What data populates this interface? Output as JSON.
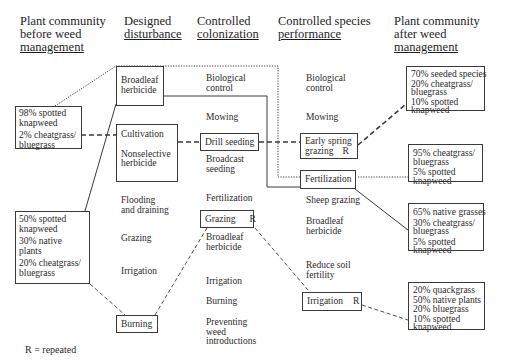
{
  "headers": [
    {
      "id": "before",
      "lines": [
        "Plant community",
        "before weed"
      ],
      "underlined": "management"
    },
    {
      "id": "disturbance",
      "lines": [
        "Designed"
      ],
      "underlined": "disturbance"
    },
    {
      "id": "colonization",
      "lines": [
        "Controlled"
      ],
      "underlined": "colonization"
    },
    {
      "id": "performance",
      "lines": [
        "Controlled species"
      ],
      "underlined": "performance"
    },
    {
      "id": "after",
      "lines": [
        "Plant community",
        "after weed"
      ],
      "underlined": "management"
    }
  ],
  "before_communities": [
    {
      "lines": [
        "98% spotted",
        "knapweed",
        "2% cheatgrass/",
        "bluegrass"
      ]
    },
    {
      "lines": [
        "50% spotted",
        "knapweed",
        "30% native",
        "plants",
        "20% cheatgrass/",
        "bluegrass"
      ]
    }
  ],
  "disturbance": {
    "boxes": [
      {
        "lines": [
          "Broadleaf",
          "herbicide"
        ]
      },
      {
        "lines": [
          "Cultivation",
          "Nonselective",
          "herbicide"
        ]
      },
      {
        "lines": [
          "Burning"
        ]
      }
    ],
    "labels": [
      {
        "lines": [
          "Flooding",
          "and draining"
        ]
      },
      {
        "lines": [
          "Grazing"
        ]
      },
      {
        "lines": [
          "Irrigation"
        ]
      }
    ]
  },
  "colonization": {
    "labels": [
      {
        "lines": [
          "Biological",
          "control"
        ]
      },
      {
        "lines": [
          "Mowing"
        ]
      },
      {
        "lines": [
          "Broadcast",
          "seeding"
        ]
      },
      {
        "lines": [
          "Fertilization"
        ]
      },
      {
        "lines": [
          "Broadleaf",
          "herbicide"
        ]
      },
      {
        "lines": [
          "Irrigation"
        ]
      },
      {
        "lines": [
          "Burning"
        ]
      },
      {
        "lines": [
          "Preventing",
          "weed",
          "introductions"
        ]
      }
    ],
    "boxes": [
      {
        "label": "Drill seeding",
        "repeat": ""
      },
      {
        "label": "Grazing",
        "repeat": "R"
      }
    ]
  },
  "performance": {
    "labels": [
      {
        "lines": [
          "Biological",
          "control"
        ]
      },
      {
        "lines": [
          "Mowing"
        ]
      },
      {
        "lines": [
          "Sheep grazing"
        ]
      },
      {
        "lines": [
          "Broadleaf",
          "herbicide"
        ]
      },
      {
        "lines": [
          "Reduce soil",
          "fertility"
        ]
      }
    ],
    "boxes": [
      {
        "lines": [
          "Early spring",
          "grazing"
        ],
        "repeat": "R"
      },
      {
        "label": "Fertilization",
        "repeat": ""
      },
      {
        "label": "Irrigation",
        "repeat": "R"
      }
    ]
  },
  "after_communities": [
    {
      "lines": [
        "70% seeded species",
        "20% cheatgrass/",
        "bluegrass",
        "10% spotted",
        "knapweed"
      ]
    },
    {
      "lines": [
        "95% cheatgrass/",
        "bluegrass",
        "5% spotted",
        "knapweed"
      ]
    },
    {
      "lines": [
        "65% native grasses",
        "30% cheatgrass/",
        "bluegrass",
        "5% spotted",
        "knapweed"
      ]
    },
    {
      "lines": [
        "20% quackgrass",
        "50% native plants",
        "20% bluegrass",
        "10% spotted",
        "knapweed"
      ]
    }
  ],
  "legend": {
    "text": "R = repeated"
  },
  "colors": {
    "line": "#3a3a3a",
    "text": "#2a2a2a",
    "background": "#ffffff"
  }
}
